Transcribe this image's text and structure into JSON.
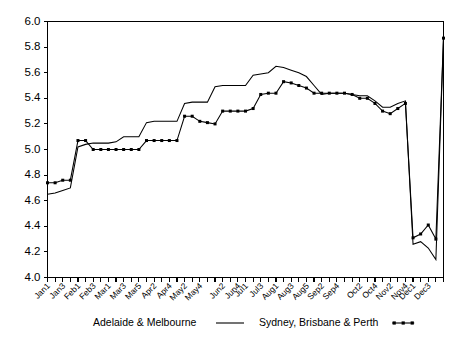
{
  "chart_data": {
    "type": "line",
    "title": "",
    "subtitle": "",
    "xlabel": "",
    "ylabel": "",
    "ylim": [
      4.0,
      6.0
    ],
    "y_tick_step": 0.2,
    "grid": false,
    "legend_position": "bottom",
    "y_ticks": [
      "4.0",
      "4.2",
      "4.4",
      "4.6",
      "4.8",
      "5.0",
      "5.2",
      "5.4",
      "5.6",
      "5.8",
      "6.0"
    ],
    "y_tick_values": [
      4.0,
      4.2,
      4.4,
      4.6,
      4.8,
      5.0,
      5.2,
      5.4,
      5.6,
      5.8,
      6.0
    ],
    "categories": [
      "Jan1",
      "Jan2",
      "Jan3",
      "Jan4",
      "Feb1",
      "Feb2",
      "Feb3",
      "Feb4",
      "Mar1",
      "Mar2",
      "Mar3",
      "Mar4",
      "Mar5",
      "Apr1",
      "Apr2",
      "Apr3",
      "Apr4",
      "May1",
      "May2",
      "May3",
      "May4",
      "May5",
      "Jun1",
      "Jun2",
      "Jun3",
      "Jun4",
      "Jul1",
      "Jul2",
      "Jul3",
      "Jul4",
      "Aug1",
      "Aug2",
      "Aug3",
      "Aug4",
      "Aug5",
      "Sep1",
      "Sep2",
      "Sep3",
      "Sep4",
      "Sep5",
      "Oct1",
      "Oct2",
      "Oct3",
      "Oct4",
      "Nov1",
      "Nov2",
      "Nov3",
      "Nov4",
      "Dec1",
      "Dec2",
      "Dec3",
      "Dec4",
      "Dec5"
    ],
    "x_tick_labels_shown": [
      "Jan1",
      "Jan3",
      "Feb1",
      "Feb3",
      "Mar1",
      "Mar3",
      "Mar5",
      "Apr2",
      "Apr4",
      "May2",
      "May4",
      "Jun2",
      "Jun4",
      "Jul1",
      "Jul3",
      "Aug1",
      "Aug3",
      "Aug5",
      "Sep2",
      "Sep4",
      "Oct2",
      "Oct4",
      "Nov2",
      "Nov4",
      "Dec1",
      "Dec3"
    ],
    "series": [
      {
        "name": "Adelaide & Melbourne",
        "marker": "none",
        "values": [
          4.65,
          4.66,
          4.68,
          4.7,
          5.02,
          5.04,
          5.05,
          5.05,
          5.05,
          5.06,
          5.1,
          5.1,
          5.1,
          5.21,
          5.22,
          5.22,
          5.22,
          5.22,
          5.36,
          5.37,
          5.37,
          5.37,
          5.49,
          5.5,
          5.5,
          5.5,
          5.5,
          5.58,
          5.59,
          5.6,
          5.65,
          5.64,
          5.62,
          5.6,
          5.57,
          5.5,
          5.43,
          5.44,
          5.44,
          5.44,
          5.43,
          5.42,
          5.42,
          5.38,
          5.33,
          5.33,
          5.36,
          5.38,
          4.26,
          4.28,
          4.23,
          4.14,
          5.87
        ]
      },
      {
        "name": "Sydney, Brisbane & Perth",
        "marker": "square",
        "values": [
          4.74,
          4.74,
          4.76,
          4.76,
          5.07,
          5.07,
          5.0,
          5.0,
          5.0,
          5.0,
          5.0,
          5.0,
          5.0,
          5.07,
          5.07,
          5.07,
          5.07,
          5.07,
          5.26,
          5.26,
          5.22,
          5.21,
          5.2,
          5.3,
          5.3,
          5.3,
          5.3,
          5.32,
          5.43,
          5.44,
          5.44,
          5.53,
          5.52,
          5.5,
          5.48,
          5.44,
          5.44,
          5.44,
          5.44,
          5.44,
          5.43,
          5.4,
          5.4,
          5.36,
          5.3,
          5.28,
          5.32,
          5.36,
          4.31,
          4.34,
          4.41,
          4.3,
          5.87
        ]
      }
    ]
  },
  "legend": {
    "entries": [
      {
        "label": "Adelaide & Melbourne",
        "style": "line"
      },
      {
        "label": "Sydney, Brisbane & Perth",
        "style": "line-with-markers"
      }
    ]
  },
  "colors": {
    "axis": "#000000",
    "series_1": "#000000",
    "series_2": "#000000",
    "background": "#ffffff"
  }
}
